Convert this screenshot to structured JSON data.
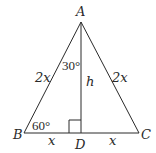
{
  "figure": {
    "type": "triangle-diagram",
    "vertices": {
      "A": {
        "label": "A"
      },
      "B": {
        "label": "B"
      },
      "C": {
        "label": "C"
      },
      "D": {
        "label": "D"
      }
    },
    "sides": {
      "AB": "2x",
      "AC": "2x",
      "BD": "x",
      "DC": "x",
      "AD": "h"
    },
    "angles": {
      "BAD": "30°",
      "ABD": "60°"
    },
    "right_angle_at": "D",
    "stroke_color": "#2a2a2a"
  }
}
